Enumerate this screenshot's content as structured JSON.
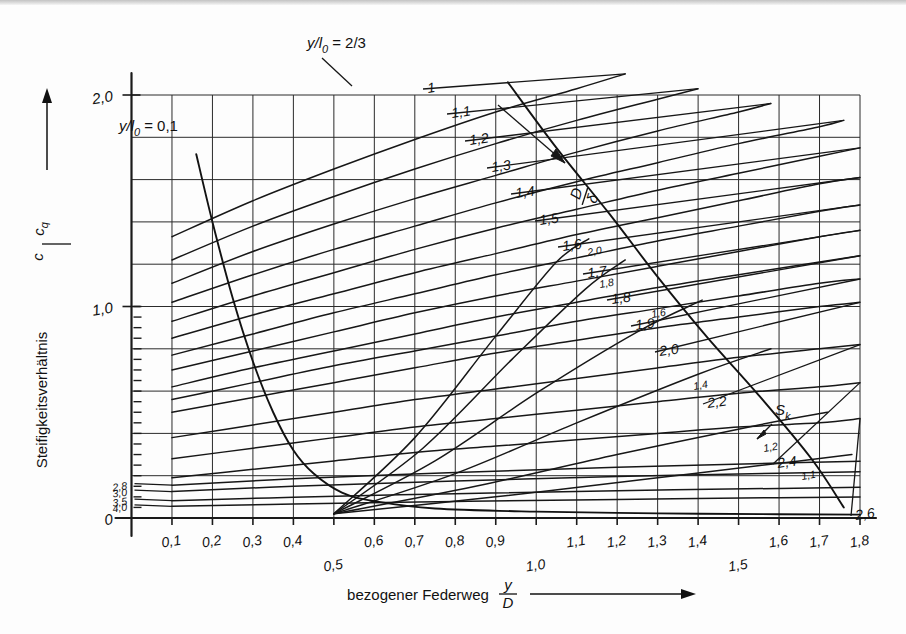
{
  "figure": {
    "name": "Steifigkeitsverhaeltnis Tellerfeder-Diagramm",
    "background_color": "#fdfdfd",
    "ink_color": "#171717"
  },
  "axes": {
    "x": {
      "title_text": "bezogener Federweg",
      "title_symbol_num": "y",
      "title_symbol_den": "D",
      "arrow": "right-arrow-icon",
      "min": 0,
      "max": 1.8,
      "tick_labels": [
        "0,1",
        "0,2",
        "0,3",
        "0,4",
        "0,5",
        "0,6",
        "0,7",
        "0,8",
        "0,9",
        "1,0",
        "1,1",
        "1,2",
        "1,3",
        "1,4",
        "1,5",
        "1,6",
        "1,7",
        "1,8"
      ],
      "tick_values": [
        0.1,
        0.2,
        0.3,
        0.4,
        0.5,
        0.6,
        0.7,
        0.8,
        0.9,
        1.0,
        1.1,
        1.2,
        1.3,
        1.4,
        1.5,
        1.6,
        1.7,
        1.8
      ],
      "staggered_low_labels": [
        "0,5",
        "1,0",
        "1,5"
      ]
    },
    "y": {
      "title_text": "Steifigkeitsverhältnis",
      "title_symbol_num": "c",
      "title_symbol_den": "c",
      "title_symbol_den_sub": "q",
      "arrow": "up-arrow-icon",
      "min": 0,
      "max": 2.0,
      "tick_labels": [
        "0",
        "1,0",
        "2,0"
      ],
      "tick_values": [
        0,
        1.0,
        2.0
      ],
      "gridline_values": [
        0,
        0.2,
        0.4,
        0.6,
        0.8,
        1.0,
        1.2,
        1.4,
        1.6,
        1.8,
        2.0
      ]
    }
  },
  "annotations": {
    "top_note": {
      "num": "y",
      "den": "l",
      "den_sub": "0",
      "equals": "= 2/3",
      "full": "y/l0 = 2/3"
    },
    "inner_note": {
      "num": "y",
      "den": "l",
      "den_sub": "0",
      "equals": "= 0,1",
      "full": "y/l0 = 0,1"
    },
    "ratio_arrow_label": {
      "num": "D",
      "den": "δ",
      "full": "D/δ",
      "icon": "diagonal-arrow-icon"
    },
    "sk_label": {
      "text": "S",
      "sub": "k",
      "full": "S_k",
      "icon": "arrow-pointer-icon"
    }
  },
  "chart_data": {
    "type": "line",
    "xlabel": "bezogener Federweg y/D",
    "ylabel": "Steifigkeitsverhältnis c/cq",
    "xlim": [
      0,
      1.8
    ],
    "ylim": [
      0,
      2.0
    ],
    "grid": true,
    "legend": "inline-curve-labels",
    "families": [
      {
        "name": "h0/t Kennlinien (steigend)",
        "label_position": "right-end-of-curve",
        "labels": [
          "1",
          "1,1",
          "1,2",
          "1,3",
          "1,4",
          "1,5",
          "1,6",
          "1,7",
          "1,8",
          "1,9",
          "2,0",
          "2,2",
          "2,4",
          "2,6"
        ],
        "series": [
          {
            "name": "1",
            "x": [
              0.1,
              0.3,
              0.5,
              0.7,
              0.9,
              1.1,
              1.22
            ],
            "y": [
              1.33,
              1.5,
              1.65,
              1.79,
              1.92,
              2.03,
              2.1
            ]
          },
          {
            "name": "1,1",
            "x": [
              0.1,
              0.3,
              0.5,
              0.7,
              0.9,
              1.1,
              1.3,
              1.4
            ],
            "y": [
              1.22,
              1.38,
              1.52,
              1.65,
              1.77,
              1.88,
              1.98,
              2.03
            ]
          },
          {
            "name": "1,2",
            "x": [
              0.1,
              0.3,
              0.5,
              0.7,
              0.9,
              1.1,
              1.3,
              1.5,
              1.58
            ],
            "y": [
              1.11,
              1.26,
              1.39,
              1.51,
              1.62,
              1.73,
              1.83,
              1.92,
              1.96
            ]
          },
          {
            "name": "1,3",
            "x": [
              0.1,
              0.3,
              0.5,
              0.7,
              0.9,
              1.1,
              1.3,
              1.5,
              1.7,
              1.76
            ],
            "y": [
              1.02,
              1.15,
              1.27,
              1.38,
              1.49,
              1.59,
              1.68,
              1.77,
              1.85,
              1.88
            ]
          },
          {
            "name": "1,4",
            "x": [
              0.1,
              0.3,
              0.5,
              0.7,
              0.9,
              1.1,
              1.3,
              1.5,
              1.7,
              1.8
            ],
            "y": [
              0.93,
              1.05,
              1.16,
              1.27,
              1.37,
              1.46,
              1.55,
              1.63,
              1.71,
              1.75
            ]
          },
          {
            "name": "1,5",
            "x": [
              0.1,
              0.3,
              0.5,
              0.7,
              0.9,
              1.1,
              1.3,
              1.5,
              1.7,
              1.8
            ],
            "y": [
              0.85,
              0.96,
              1.06,
              1.16,
              1.25,
              1.34,
              1.42,
              1.5,
              1.58,
              1.61
            ]
          },
          {
            "name": "1,6",
            "x": [
              0.1,
              0.3,
              0.5,
              0.7,
              0.9,
              1.1,
              1.3,
              1.5,
              1.7,
              1.8
            ],
            "y": [
              0.77,
              0.87,
              0.97,
              1.06,
              1.15,
              1.23,
              1.31,
              1.38,
              1.45,
              1.48
            ]
          },
          {
            "name": "1,7",
            "x": [
              0.1,
              0.3,
              0.5,
              0.7,
              0.9,
              1.1,
              1.3,
              1.5,
              1.7,
              1.8
            ],
            "y": [
              0.7,
              0.79,
              0.88,
              0.97,
              1.05,
              1.12,
              1.19,
              1.26,
              1.33,
              1.36
            ]
          },
          {
            "name": "1,8",
            "x": [
              0.1,
              0.3,
              0.5,
              0.7,
              0.9,
              1.1,
              1.3,
              1.5,
              1.7,
              1.8
            ],
            "y": [
              0.62,
              0.71,
              0.79,
              0.87,
              0.95,
              1.02,
              1.09,
              1.15,
              1.21,
              1.24
            ]
          },
          {
            "name": "1,9",
            "x": [
              0.1,
              0.3,
              0.5,
              0.7,
              0.9,
              1.1,
              1.3,
              1.5,
              1.7,
              1.8
            ],
            "y": [
              0.56,
              0.64,
              0.72,
              0.79,
              0.86,
              0.93,
              0.99,
              1.05,
              1.11,
              1.13
            ]
          },
          {
            "name": "2,0",
            "x": [
              0.1,
              0.3,
              0.5,
              0.7,
              0.9,
              1.1,
              1.3,
              1.5,
              1.7,
              1.8
            ],
            "y": [
              0.5,
              0.57,
              0.64,
              0.71,
              0.78,
              0.84,
              0.9,
              0.95,
              1.0,
              1.02
            ]
          },
          {
            "name": "2,2",
            "x": [
              0.1,
              0.3,
              0.5,
              0.7,
              0.9,
              1.1,
              1.3,
              1.5,
              1.7,
              1.8
            ],
            "y": [
              0.38,
              0.44,
              0.5,
              0.56,
              0.61,
              0.66,
              0.71,
              0.76,
              0.8,
              0.82
            ]
          },
          {
            "name": "2,4",
            "x": [
              0.1,
              0.3,
              0.5,
              0.7,
              0.9,
              1.1,
              1.3,
              1.5,
              1.7,
              1.8
            ],
            "y": [
              0.28,
              0.33,
              0.38,
              0.43,
              0.47,
              0.51,
              0.55,
              0.59,
              0.62,
              0.64
            ]
          },
          {
            "name": "2,6",
            "x": [
              0.1,
              0.3,
              0.5,
              0.7,
              0.9,
              1.1,
              1.3,
              1.5,
              1.7,
              1.8
            ],
            "y": [
              0.19,
              0.23,
              0.27,
              0.31,
              0.34,
              0.37,
              0.4,
              0.43,
              0.45,
              0.47
            ]
          }
        ]
      },
      {
        "name": "h0/t Kennlinien flach (links beschriftet)",
        "label_position": "left-edge",
        "labels": [
          "2,8",
          "3,0",
          "3,5",
          "4,0"
        ],
        "series": [
          {
            "name": "2,8",
            "x": [
              0.1,
              0.4,
              0.8,
              1.2,
              1.6,
              1.8
            ],
            "y": [
              0.155,
              0.185,
              0.215,
              0.24,
              0.26,
              0.268
            ]
          },
          {
            "name": "3,0",
            "x": [
              0.1,
              0.4,
              0.8,
              1.2,
              1.6,
              1.8
            ],
            "y": [
              0.125,
              0.15,
              0.175,
              0.196,
              0.212,
              0.219
            ]
          },
          {
            "name": "3,5",
            "x": [
              0.1,
              0.4,
              0.8,
              1.2,
              1.6,
              1.8
            ],
            "y": [
              0.082,
              0.098,
              0.115,
              0.129,
              0.14,
              0.145
            ]
          },
          {
            "name": "4,0",
            "x": [
              0.1,
              0.4,
              0.8,
              1.2,
              1.6,
              1.8
            ],
            "y": [
              0.055,
              0.066,
              0.078,
              0.088,
              0.096,
              0.099
            ]
          }
        ]
      },
      {
        "name": "Sk Knicklinien (steigend, klein beschriftet)",
        "label_position": "curve-end-small-italic",
        "labels": [
          "2,0",
          "1,8",
          "1,6",
          "1,4",
          "1,2",
          "1,1"
        ],
        "series": [
          {
            "name": "2,0",
            "x": [
              0.5,
              0.7,
              0.9,
              1.05,
              1.13
            ],
            "y": [
              0.02,
              0.38,
              0.86,
              1.21,
              1.32
            ]
          },
          {
            "name": "1,8",
            "x": [
              0.5,
              0.72,
              0.94,
              1.12,
              1.22
            ],
            "y": [
              0.02,
              0.33,
              0.75,
              1.08,
              1.22
            ]
          },
          {
            "name": "1,6",
            "x": [
              0.5,
              0.75,
              1.0,
              1.25,
              1.41
            ],
            "y": [
              0.02,
              0.27,
              0.59,
              0.88,
              1.03
            ]
          },
          {
            "name": "1,4",
            "x": [
              0.5,
              0.8,
              1.1,
              1.4,
              1.58
            ],
            "y": [
              0.02,
              0.21,
              0.45,
              0.68,
              0.8
            ]
          },
          {
            "name": "1,2",
            "x": [
              0.5,
              0.85,
              1.2,
              1.55,
              1.72
            ],
            "y": [
              0.02,
              0.15,
              0.3,
              0.44,
              0.5
            ]
          },
          {
            "name": "1,1",
            "x": [
              0.5,
              0.9,
              1.3,
              1.65,
              1.78
            ],
            "y": [
              0.02,
              0.1,
              0.19,
              0.27,
              0.3
            ]
          }
        ]
      },
      {
        "name": "Grenzkurve y/l0 = 0,1",
        "label_position": "inner-left",
        "series": [
          {
            "name": "y/l0=0,1",
            "x": [
              0.16,
              0.2,
              0.25,
              0.3,
              0.35,
              0.4,
              0.45,
              0.52,
              0.6,
              0.75,
              1.0,
              1.3,
              1.6,
              1.8
            ],
            "y": [
              1.72,
              1.4,
              1.04,
              0.74,
              0.5,
              0.32,
              0.21,
              0.12,
              0.08,
              0.045,
              0.03,
              0.022,
              0.018,
              0.016
            ]
          }
        ]
      },
      {
        "name": "Grenzkurve y/l0 = 2/3",
        "label_position": "top-right-diagonal",
        "series": [
          {
            "name": "y/l0=2/3",
            "x": [
              0.93,
              1.05,
              1.18,
              1.3,
              1.42,
              1.55,
              1.68,
              1.76
            ],
            "y": [
              2.06,
              1.75,
              1.44,
              1.14,
              0.86,
              0.58,
              0.28,
              0.05
            ]
          }
        ]
      }
    ]
  }
}
